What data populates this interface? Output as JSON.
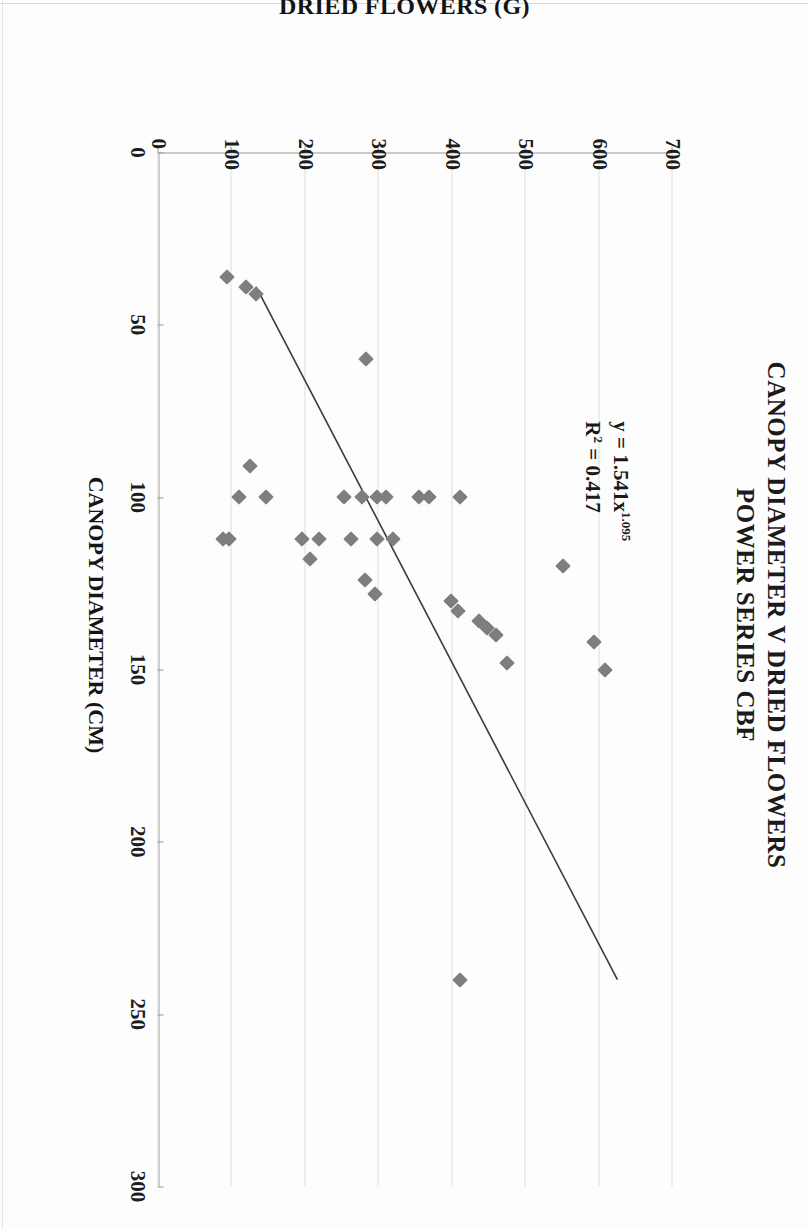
{
  "chart_data": {
    "type": "scatter",
    "title": "CANOPY DIAMETER V DRIED FLOWERS POWER SERIES CBF",
    "title_lines": [
      "CANOPY DIAMETER V DRIED FLOWERS",
      "POWER SERIES CBF"
    ],
    "xlabel": "CANOPY DIAMETER (CM)",
    "ylabel": "DRIED FLOWERS (G)",
    "xlim": [
      0,
      300
    ],
    "ylim": [
      0,
      700
    ],
    "xticks": [
      "0",
      "50",
      "100",
      "150",
      "200",
      "250",
      "300"
    ],
    "yticks": [
      "0",
      "100",
      "200",
      "300",
      "400",
      "500",
      "600",
      "700"
    ],
    "xtick_values": [
      0,
      50,
      100,
      150,
      200,
      250,
      300
    ],
    "ytick_values": [
      0,
      100,
      200,
      300,
      400,
      500,
      600,
      700
    ],
    "grid": "vertical-only-on-value-axis",
    "legend": "none",
    "marker_shape": "diamond",
    "marker_color": "#7e7e7e",
    "trendline": {
      "type": "power",
      "equation": "y = 1.541x",
      "exponent": "1.095",
      "r2_label": "R",
      "r2_value": " = 0.417",
      "color": "#3a3a3a",
      "x_start": 39,
      "y_start": 133,
      "x_end": 240,
      "y_end": 625
    },
    "annotation": {
      "line1": "y = 1.541x",
      "line1_sup": "1.095",
      "line2_prefix": "R",
      "line2_sup": "2",
      "line2_suffix": " = 0.417"
    },
    "points": [
      {
        "x": 41,
        "y": 133
      },
      {
        "x": 36,
        "y": 93
      },
      {
        "x": 39,
        "y": 119
      },
      {
        "x": 60,
        "y": 283
      },
      {
        "x": 91,
        "y": 124
      },
      {
        "x": 100,
        "y": 109
      },
      {
        "x": 100,
        "y": 146
      },
      {
        "x": 100,
        "y": 252
      },
      {
        "x": 100,
        "y": 277
      },
      {
        "x": 100,
        "y": 298
      },
      {
        "x": 100,
        "y": 310
      },
      {
        "x": 100,
        "y": 355
      },
      {
        "x": 100,
        "y": 368
      },
      {
        "x": 100,
        "y": 410
      },
      {
        "x": 112,
        "y": 88
      },
      {
        "x": 112,
        "y": 96
      },
      {
        "x": 112,
        "y": 196
      },
      {
        "x": 112,
        "y": 219
      },
      {
        "x": 112,
        "y": 262
      },
      {
        "x": 112,
        "y": 297
      },
      {
        "x": 112,
        "y": 320
      },
      {
        "x": 118,
        "y": 207
      },
      {
        "x": 120,
        "y": 551
      },
      {
        "x": 124,
        "y": 281
      },
      {
        "x": 128,
        "y": 295
      },
      {
        "x": 130,
        "y": 399
      },
      {
        "x": 133,
        "y": 408
      },
      {
        "x": 136,
        "y": 437
      },
      {
        "x": 138,
        "y": 447
      },
      {
        "x": 140,
        "y": 459
      },
      {
        "x": 142,
        "y": 593
      },
      {
        "x": 148,
        "y": 474
      },
      {
        "x": 150,
        "y": 608
      },
      {
        "x": 240,
        "y": 410
      }
    ]
  }
}
